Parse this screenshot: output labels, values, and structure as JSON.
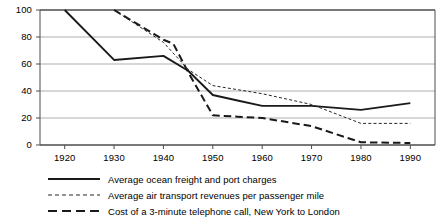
{
  "chart_data": {
    "type": "line",
    "title": "",
    "xlabel": "",
    "ylabel": "",
    "xlim": [
      1915,
      1995
    ],
    "ylim": [
      0,
      100
    ],
    "yticks": [
      0,
      20,
      40,
      60,
      80,
      100
    ],
    "xticks": [
      1920,
      1930,
      1940,
      1950,
      1960,
      1970,
      1980,
      1990
    ],
    "grid": true,
    "legend_position": "bottom-left",
    "series": [
      {
        "name": "Average ocean freight and port charges",
        "style": "solid",
        "color": "#1a1a1a",
        "x": [
          1920,
          1930,
          1940,
          1945,
          1950,
          1955,
          1960,
          1970,
          1980,
          1990
        ],
        "values": [
          100,
          63,
          66,
          55,
          37,
          33,
          29,
          29,
          26,
          31
        ]
      },
      {
        "name": "Average air transport revenues per passenger mile",
        "style": "dotted",
        "color": "#262626",
        "x": [
          1930,
          1940,
          1945,
          1950,
          1960,
          1970,
          1980,
          1990
        ],
        "values": [
          100,
          76,
          56,
          44,
          38,
          30,
          16,
          16
        ]
      },
      {
        "name": "Cost of a 3-minute telephone call, New York to London",
        "style": "dashed",
        "color": "#1a1a1a",
        "x": [
          1930,
          1940,
          1942,
          1945,
          1950,
          1955,
          1960,
          1970,
          1980,
          1990
        ],
        "values": [
          100,
          78,
          75,
          54,
          22,
          21,
          20,
          14,
          2,
          1.5
        ]
      }
    ]
  },
  "axis": {
    "y_labels": [
      "100",
      "80",
      "60",
      "40",
      "20",
      "0"
    ],
    "x_labels": [
      "1920",
      "1930",
      "1940",
      "1950",
      "1960",
      "1970",
      "1980",
      "1990"
    ]
  },
  "legend": {
    "items": [
      {
        "label": "Average ocean freight and port charges",
        "style": "solid"
      },
      {
        "label": "Average air transport revenues per passenger mile",
        "style": "dotted"
      },
      {
        "label": "Cost of a 3-minute telephone call, New York to London",
        "style": "dashed"
      }
    ]
  }
}
